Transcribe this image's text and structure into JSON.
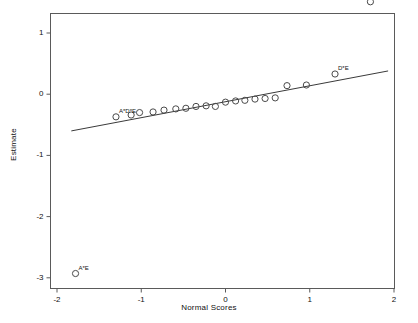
{
  "chart_data": {
    "type": "scatter",
    "title": "",
    "xlabel": "Normal Scores",
    "ylabel": "Estimate",
    "xlim": [
      -2,
      2
    ],
    "ylim": [
      -3,
      1.6
    ],
    "xticks": [
      "-2",
      "-1",
      "0",
      "1",
      "2"
    ],
    "xtick_values": [
      -2,
      -1,
      0,
      1,
      2
    ],
    "yticks": [
      "1",
      "0",
      "-1",
      "-2",
      "-3"
    ],
    "ytick_values": [
      1,
      0,
      -1,
      -2,
      -3
    ],
    "grid": false,
    "legend": "none",
    "marker": "open-circle",
    "points": [
      {
        "x": -1.78,
        "y": -2.93,
        "label": "A*E"
      },
      {
        "x": -1.3,
        "y": -0.37,
        "label": "A*D*E"
      },
      {
        "x": -1.12,
        "y": -0.34,
        "label": ""
      },
      {
        "x": -1.02,
        "y": -0.3,
        "label": ""
      },
      {
        "x": -0.86,
        "y": -0.29,
        "label": ""
      },
      {
        "x": -0.73,
        "y": -0.26,
        "label": ""
      },
      {
        "x": -0.59,
        "y": -0.24,
        "label": ""
      },
      {
        "x": -0.47,
        "y": -0.23,
        "label": ""
      },
      {
        "x": -0.35,
        "y": -0.2,
        "label": ""
      },
      {
        "x": -0.23,
        "y": -0.19,
        "label": ""
      },
      {
        "x": -0.12,
        "y": -0.2,
        "label": ""
      },
      {
        "x": 0.0,
        "y": -0.13,
        "label": ""
      },
      {
        "x": 0.12,
        "y": -0.11,
        "label": ""
      },
      {
        "x": 0.23,
        "y": -0.1,
        "label": ""
      },
      {
        "x": 0.35,
        "y": -0.08,
        "label": ""
      },
      {
        "x": 0.47,
        "y": -0.07,
        "label": ""
      },
      {
        "x": 0.59,
        "y": -0.06,
        "label": ""
      },
      {
        "x": 0.73,
        "y": 0.14,
        "label": ""
      },
      {
        "x": 0.96,
        "y": 0.15,
        "label": ""
      },
      {
        "x": 1.3,
        "y": 0.33,
        "label": "D*E"
      },
      {
        "x": 1.72,
        "y": 1.51,
        "label": "E"
      }
    ],
    "fit_line": {
      "x_start": -1.83,
      "y_start": -0.6,
      "x_end": 1.93,
      "y_end": 0.38
    }
  }
}
